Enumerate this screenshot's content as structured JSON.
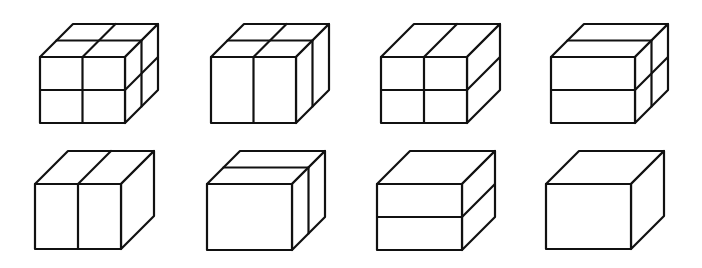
{
  "figure": {
    "stroke_color": "#111111",
    "background": "#ffffff",
    "depth_offset": {
      "dx": 33,
      "dy": -33
    },
    "cubes": [
      {
        "id": "cube-1",
        "x": 40,
        "y": 57,
        "w": 85,
        "h": 66,
        "split_x": true,
        "split_y": true,
        "split_z": true
      },
      {
        "id": "cube-2",
        "x": 211,
        "y": 57,
        "w": 85,
        "h": 66,
        "split_x": true,
        "split_y": false,
        "split_z": true
      },
      {
        "id": "cube-3",
        "x": 381,
        "y": 57,
        "w": 86,
        "h": 66,
        "split_x": true,
        "split_y": true,
        "split_z": false
      },
      {
        "id": "cube-4",
        "x": 551,
        "y": 57,
        "w": 84,
        "h": 66,
        "split_x": false,
        "split_y": true,
        "split_z": true
      },
      {
        "id": "cube-5",
        "x": 35,
        "y": 184,
        "w": 86,
        "h": 65,
        "split_x": true,
        "split_y": false,
        "split_z": false
      },
      {
        "id": "cube-6",
        "x": 207,
        "y": 184,
        "w": 85,
        "h": 66,
        "split_x": false,
        "split_y": false,
        "split_z": true
      },
      {
        "id": "cube-7",
        "x": 377,
        "y": 184,
        "w": 85,
        "h": 66,
        "split_x": false,
        "split_y": true,
        "split_z": false
      },
      {
        "id": "cube-8",
        "x": 546,
        "y": 184,
        "w": 85,
        "h": 65,
        "split_x": false,
        "split_y": false,
        "split_z": false
      }
    ]
  }
}
